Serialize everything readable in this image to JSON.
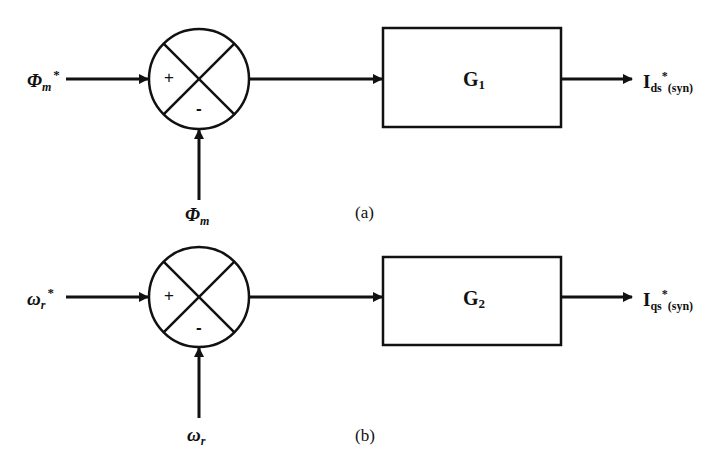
{
  "diagram": {
    "type": "block-diagram",
    "stroke_color": "#111111",
    "background": "#ffffff",
    "panels": [
      {
        "id": "a",
        "caption": "(a)",
        "reference_input": {
          "symbol": "Φ",
          "subscript": "m",
          "superscript": "*"
        },
        "feedback_input": {
          "symbol": "Φ",
          "subscript": "m"
        },
        "summing_junction": {
          "plus_sign": "+",
          "minus_sign": "-"
        },
        "block": {
          "name": "G",
          "subscript": "1"
        },
        "output": {
          "symbol": "I",
          "subscript": "ds",
          "superscript": "*",
          "suffix": "(syn)"
        }
      },
      {
        "id": "b",
        "caption": "(b)",
        "reference_input": {
          "symbol": "ω",
          "subscript": "r",
          "superscript": "*"
        },
        "feedback_input": {
          "symbol": "ω",
          "subscript": "r"
        },
        "summing_junction": {
          "plus_sign": "+",
          "minus_sign": "-"
        },
        "block": {
          "name": "G",
          "subscript": "2"
        },
        "output": {
          "symbol": "I",
          "subscript": "qs",
          "superscript": "*",
          "suffix": "(syn)"
        }
      }
    ]
  }
}
